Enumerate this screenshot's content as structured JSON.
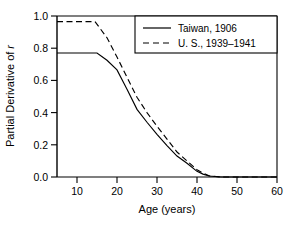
{
  "chart_data": {
    "type": "line",
    "title": "",
    "xlabel": "Age (years)",
    "ylabel": "Partial Derivative of r",
    "ylabel_prefix": "Partial Derivative of ",
    "ylabel_italic": "r",
    "xlim": [
      5,
      60
    ],
    "ylim": [
      0.0,
      1.0
    ],
    "grid": false,
    "legend_position": "top-right",
    "xticks": [
      10,
      20,
      30,
      40,
      50,
      60
    ],
    "xtick_labels": [
      "10",
      "20",
      "30",
      "40",
      "50",
      "60"
    ],
    "yticks": [
      0.0,
      0.2,
      0.4,
      0.6,
      0.8,
      1.0
    ],
    "ytick_labels": [
      "0.0",
      "0.2",
      "0.4",
      "0.6",
      "0.8",
      "1.0"
    ],
    "series": [
      {
        "name": "Taiwan, 1906",
        "style": "solid",
        "color": "#000000",
        "x": [
          5,
          10,
          15,
          17.5,
          20,
          22.5,
          25,
          27.5,
          30,
          32.5,
          35,
          37.5,
          40,
          41.5,
          43,
          46,
          60
        ],
        "values": [
          0.77,
          0.77,
          0.77,
          0.725,
          0.665,
          0.545,
          0.42,
          0.34,
          0.265,
          0.195,
          0.13,
          0.085,
          0.035,
          0.018,
          0.006,
          0.0,
          0.0
        ]
      },
      {
        "name": "U. S., 1939–1941",
        "style": "dashed",
        "color": "#000000",
        "x": [
          5,
          10,
          14.5,
          17.5,
          20,
          22.5,
          25,
          27.5,
          30,
          32.5,
          35,
          37.5,
          40,
          41.5,
          43,
          46,
          60
        ],
        "values": [
          0.965,
          0.965,
          0.965,
          0.865,
          0.745,
          0.62,
          0.495,
          0.4,
          0.315,
          0.235,
          0.155,
          0.1,
          0.045,
          0.024,
          0.008,
          0.0,
          0.0
        ]
      }
    ]
  },
  "legend": {
    "entries": [
      {
        "label": "Taiwan, 1906",
        "style": "solid"
      },
      {
        "label": "U. S., 1939–1941",
        "style": "dashed"
      }
    ]
  },
  "axes": {
    "x_title": "Age (years)",
    "y_title_prefix": "Partial Derivative of ",
    "y_title_italic": "r"
  }
}
